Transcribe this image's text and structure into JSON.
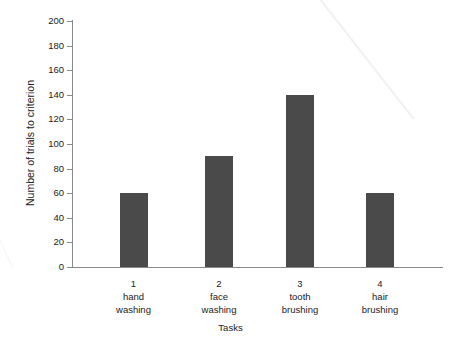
{
  "chart_data": {
    "type": "bar",
    "title": "",
    "subtitle": "",
    "xlabel": "Tasks",
    "ylabel": "Number of trials to criterion",
    "categories": [
      "hand washing",
      "face washing",
      "tooth brushing",
      "hair brushing"
    ],
    "category_indices": [
      "1",
      "2",
      "3",
      "4"
    ],
    "category_lines": [
      [
        "hand",
        "washing"
      ],
      [
        "face",
        "washing"
      ],
      [
        "tooth",
        "brushing"
      ],
      [
        "hair",
        "brushing"
      ]
    ],
    "values": [
      60,
      90,
      140,
      60
    ],
    "ylim": [
      0,
      200
    ],
    "ytick_labels": [
      "0",
      "20",
      "40",
      "60",
      "80",
      "100",
      "120",
      "140",
      "160",
      "180",
      "200"
    ],
    "ytick_values": [
      0,
      20,
      40,
      60,
      80,
      100,
      120,
      140,
      160,
      180,
      200
    ],
    "grid": false,
    "legend": null,
    "legend_position": "none",
    "bar_color": "#4a4a4a",
    "axis_color": "#8a8a8a",
    "text_color": "#1b1b1b",
    "background_color": "#ffffff"
  }
}
